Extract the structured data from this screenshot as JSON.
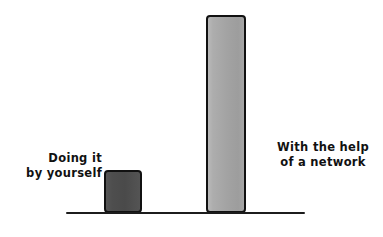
{
  "chart_data": {
    "type": "bar",
    "title": "",
    "subtitle": "",
    "xlabel": "",
    "ylabel": "",
    "grid": false,
    "legend": false,
    "legend_position": "none",
    "axis": {
      "baseline_only": true,
      "ylim": [
        0,
        100
      ]
    },
    "categories": [
      "Doing it\nby yourself",
      "With the help\nof a network"
    ],
    "values": [
      21,
      100
    ],
    "series": [
      {
        "name": "Outcome",
        "values": [
          21,
          100
        ]
      }
    ],
    "bars": [
      {
        "label": "Doing it\nby yourself",
        "value": 21,
        "fill": "#4d4d4d",
        "stroke": "#111111"
      },
      {
        "label": "With the help\nof a network",
        "value": 100,
        "fill": "#a8a8a8",
        "stroke": "#111111"
      }
    ],
    "annotations": []
  },
  "chart": {
    "background": "#ffffff",
    "axis_color": "#1c1c1c",
    "label_color": "#111111",
    "labels": {
      "left": "Doing it\nby yourself",
      "right": "With the help\nof a network"
    }
  }
}
